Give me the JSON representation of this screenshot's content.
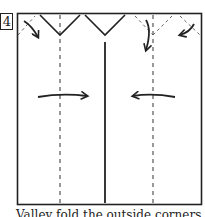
{
  "step": {
    "number": "4"
  },
  "caption": "Valley fold the outside corners in",
  "colors": {
    "ink": "#222222",
    "background": "#ffffff"
  },
  "diagram": {
    "frame": "square-paper-outline",
    "fold_lines": [
      "left-valley-dashed",
      "right-valley-dashed",
      "center-cut-solid"
    ],
    "arrows": [
      "corner-fold-arrow-top-left",
      "fold-down-arrow",
      "corner-fold-arrow-top-right",
      "fold-right-arrow",
      "fold-left-arrow"
    ]
  }
}
